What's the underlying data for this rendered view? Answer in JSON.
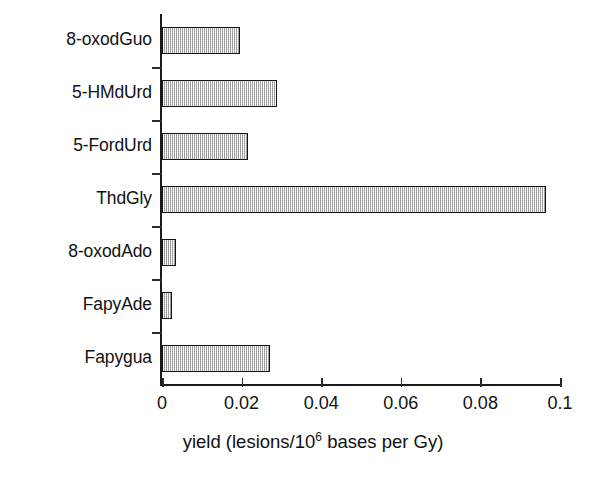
{
  "chart_data": {
    "type": "bar",
    "orientation": "horizontal",
    "title": "",
    "subtitle": "",
    "xlabel": "yield (lesions/10⁶ bases per Gy)",
    "ylabel": "",
    "categories": [
      "8-oxodGuo",
      "5-HMdUrd",
      "5-FordUrd",
      "ThdGly",
      "8-oxodAdo",
      "FapyAde",
      "Fapygua"
    ],
    "values": [
      0.0196,
      0.0289,
      0.0216,
      0.0965,
      0.0035,
      0.0025,
      0.0271
    ],
    "xlim": [
      0,
      0.1
    ],
    "ylim": null,
    "xticks": [
      0,
      0.02,
      0.04,
      0.06,
      0.08,
      0.1
    ],
    "xtick_labels": [
      "0",
      "0.02",
      "0.04",
      "0.06",
      "0.08",
      "0.1"
    ],
    "grid": false,
    "legend": null,
    "legend_position": "none",
    "bar_fill_color": "#c9c9c9",
    "bar_edge_color": "#141414",
    "axis_color": "#1a1a1a",
    "background_color": "#ffffff",
    "annotations": []
  },
  "axis_title": {
    "prefix": "yield (lesions/10",
    "superscript": "6",
    "suffix": " bases per Gy)"
  }
}
